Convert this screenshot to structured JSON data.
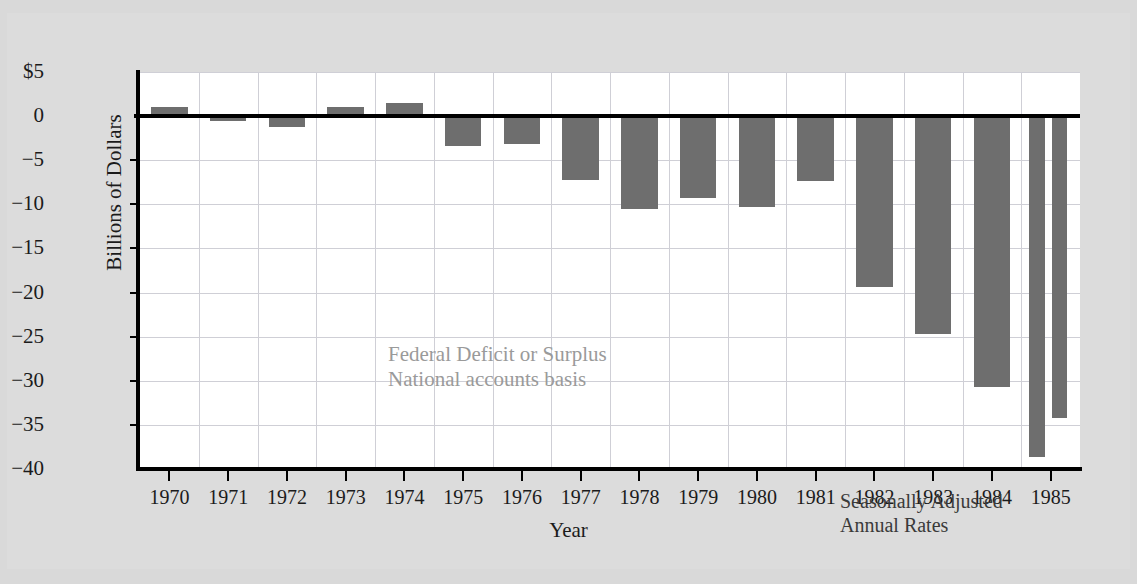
{
  "page": {
    "background_color": "#d9d9d9",
    "card_color": "#dcdcdc"
  },
  "chart_data": {
    "type": "bar",
    "title": "",
    "xlabel": "Year",
    "ylabel": "Billions of Dollars",
    "ylim": [
      -40,
      5
    ],
    "yticks": [
      5,
      0,
      -5,
      -10,
      -15,
      -20,
      -25,
      -30,
      -35,
      -40
    ],
    "ytick_labels": [
      "$5",
      "0",
      "−5",
      "−10",
      "−15",
      "−20",
      "−25",
      "−30",
      "−35",
      "−40"
    ],
    "grid": true,
    "legend": "none",
    "bar_color": "#6e6e6e",
    "categories": [
      "1970",
      "1971",
      "1972",
      "1973",
      "1974",
      "1975",
      "1976",
      "1977",
      "1978",
      "1979",
      "1980",
      "1981",
      "1982",
      "1983",
      "1984",
      "1985"
    ],
    "values": [
      1.0,
      -0.5,
      -1.2,
      1.0,
      1.5,
      -3.4,
      -3.2,
      -7.2,
      -10.5,
      -9.3,
      -10.3,
      -7.4,
      -19.4,
      -24.7,
      -30.7,
      null
    ],
    "bars": [
      {
        "year": "1970",
        "value": 1.0
      },
      {
        "year": "1971",
        "value": -0.5
      },
      {
        "year": "1972",
        "value": -1.2
      },
      {
        "year": "1973",
        "value": 1.0
      },
      {
        "year": "1974",
        "value": 1.5
      },
      {
        "year": "1975",
        "value": -3.4
      },
      {
        "year": "1976",
        "value": -3.2
      },
      {
        "year": "1977",
        "value": -7.2
      },
      {
        "year": "1978",
        "value": -10.5
      },
      {
        "year": "1979",
        "value": -9.3
      },
      {
        "year": "1980",
        "value": -10.3
      },
      {
        "year": "1981",
        "value": -7.4
      },
      {
        "year": "1982",
        "value": -19.4
      },
      {
        "year": "1983",
        "value": -24.7
      },
      {
        "year": "1984",
        "value": -30.7
      },
      {
        "year": "1985",
        "value": -38.6,
        "sub": "first"
      },
      {
        "year": "1985",
        "value": -34.2,
        "sub": "second"
      }
    ],
    "annotations": [
      {
        "id": "series-caption",
        "text": "Federal Deficit or Surplus\nNational accounts basis",
        "color": "#9a9a9a"
      },
      {
        "id": "rate-note",
        "text": "Seasonally Adjusted\nAnnual Rates",
        "color": "#3a3a3a"
      }
    ]
  }
}
